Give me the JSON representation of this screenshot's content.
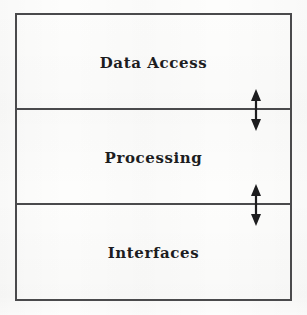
{
  "diagram": {
    "background_color": "#fdfdfc",
    "line_color": "#4a4a4c",
    "text_color": "#1d1d1f",
    "layers": [
      {
        "id": "data-access",
        "label": "Data Access"
      },
      {
        "id": "processing",
        "label": "Processing"
      },
      {
        "id": "interfaces",
        "label": "Interfaces"
      }
    ],
    "connectors": [
      {
        "id": "connector-1",
        "icon": "double-headed-vertical-arrow",
        "between": "Data Access and Processing"
      },
      {
        "id": "connector-2",
        "icon": "double-headed-vertical-arrow",
        "between": "Processing and Interfaces"
      }
    ]
  }
}
